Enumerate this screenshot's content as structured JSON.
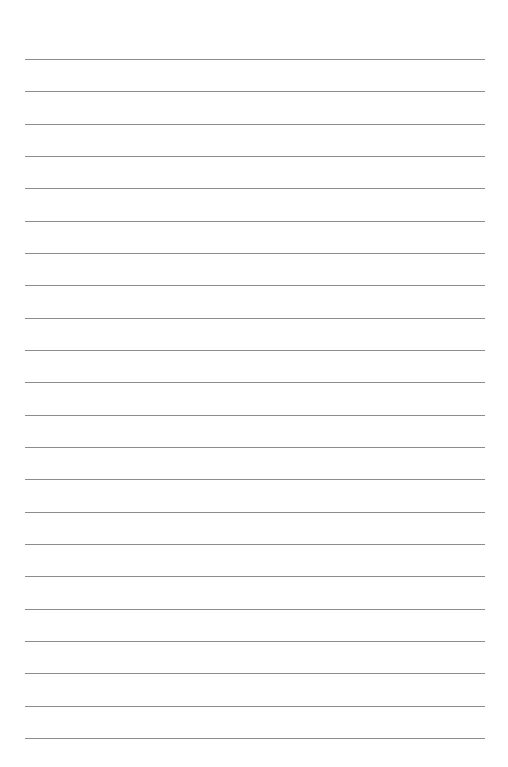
{
  "page": {
    "type": "lined-paper",
    "background_color": "#ffffff",
    "line_color": "#8c8c8c",
    "line_count": 22,
    "first_line_y": 59,
    "line_spacing": 32.33,
    "line_left": 25,
    "line_right": 485
  }
}
